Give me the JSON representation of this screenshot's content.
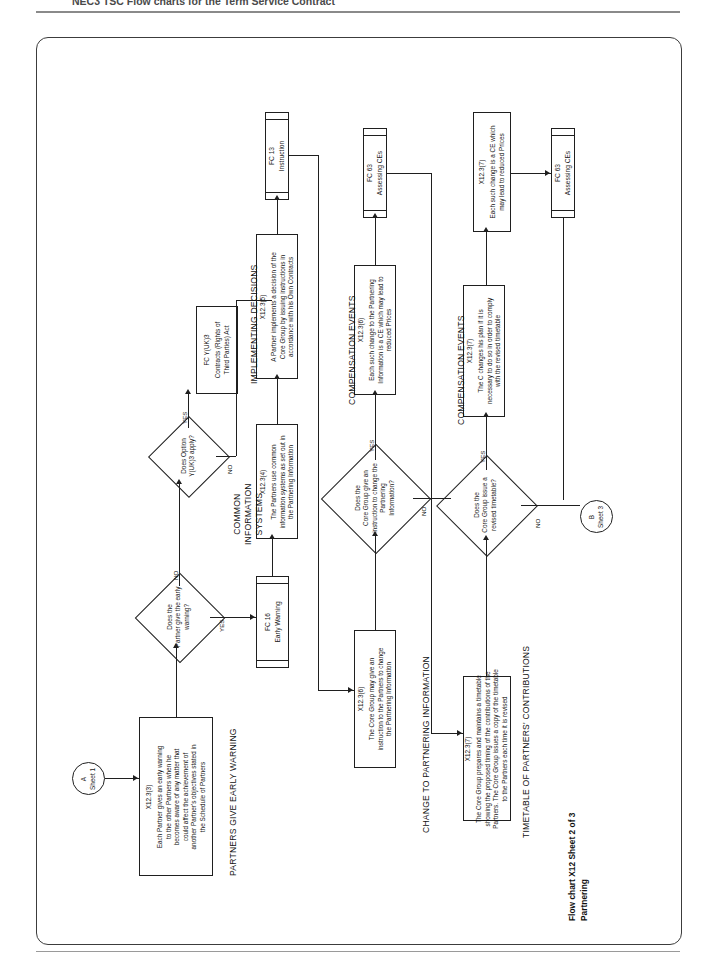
{
  "page": {
    "header_text": "NEC3  TSC  Flow charts for the Term Service Contract",
    "caption_line1": "Flow chart X12 Sheet 2 of 3",
    "caption_line2": "Partnering"
  },
  "sections": [
    {
      "id": "partners-give-early-warning",
      "label": "PARTNERS GIVE EARLY WARNING"
    },
    {
      "id": "common-information-systems",
      "label": "COMMON\nINFORMATION\nSYSTEMS"
    },
    {
      "id": "implementing-decisions",
      "label": "IMPLEMENTING DECISIONS"
    },
    {
      "id": "change-to-partnering-information",
      "label": "CHANGE TO PARTNERING INFORMATION"
    },
    {
      "id": "compensation-events-1",
      "label": "COMPENSATION EVENTS"
    },
    {
      "id": "compensation-events-2",
      "label": "COMPENSATION EVENTS"
    },
    {
      "id": "timetable-of-partners-contributions",
      "label": "TIMETABLE OF PARTNERS' CONTRIBUTIONS"
    }
  ],
  "connectors": [
    {
      "id": "a",
      "letter": "A",
      "sheet": "Sheet 1"
    },
    {
      "id": "b",
      "letter": "B",
      "sheet": "Sheet 3"
    }
  ],
  "nodes": {
    "x12_3_3": {
      "ref": "X12.3(3)",
      "text": "Each Partner gives an early warning\nto the other Partners when he\nbecomes aware of any matter that\ncould affect the achievement of\nanother Partner's objectives stated in\nthe Schedule of Partners"
    },
    "d_early_warning": {
      "text": "Does the\nPartner give the early\nwarning?"
    },
    "fc16": {
      "ref": "FC 16",
      "text": "Early Warning"
    },
    "d_option_yuk3": {
      "text": "Does Option\nY(UK)3 apply?"
    },
    "fc_yuk3": {
      "ref": "FC Y(UK)3",
      "text": "Contracts (Rights of\nThird Parties) Act"
    },
    "x12_3_4": {
      "ref": "X12.3(4)",
      "text": "The Partners use common\ninformation systems as set out in\nthe Partnering Information"
    },
    "x12_3_5": {
      "ref": "X12.3(5)",
      "text": "A Partner implements a decision of the\nCore Group by issuing instructions in\naccordance with his Own Contracts"
    },
    "fc13": {
      "ref": "FC 13",
      "text": "Instruction"
    },
    "x12_3_6_cg": {
      "ref": "X12.3(6)",
      "text": "The Core Group may give an\ninstruction to the Partners to change\nthe Partnering Information"
    },
    "d_instruction_change": {
      "text": "Does the\nCore Group give an\ninstruction to change the\nPartnering\nInformation?"
    },
    "x12_3_6_ce": {
      "ref": "X12.3(6)",
      "text": "Each such change to the Partnering\nInformation is a CE which may lead to\nreduced Prices"
    },
    "fc63_a": {
      "ref": "FC 63",
      "text": "Assessing CEs"
    },
    "x12_3_7_timetable": {
      "ref": "X12.3(7)",
      "text": "The Core Group prepares and maintains a timetable\nshowing the proposed timing of the contributions of the\nPartners. The Core Group issues a copy of the timetable\nto the Partners each time it is revised"
    },
    "d_revised_timetable": {
      "text": "Does the\nCore Group issue a\nrevised timetable?"
    },
    "x12_3_7_changes": {
      "ref": "X12.3(7)",
      "text": "The C changes his plan if it is\nnecessary to do so in order to comply\nwith the revised timetable"
    },
    "x12_3_7_ce": {
      "ref": "X12.3(7)",
      "text": "Each such change is a CE which\nmay lead to reduced Prices"
    },
    "fc63_b": {
      "ref": "FC 63",
      "text": "Assessing CEs"
    }
  },
  "branch_labels": {
    "ew_no": "NO",
    "ew_yes": "YES",
    "yuk3_yes": "YES",
    "yuk3_no": "NO",
    "instr_yes": "YES",
    "instr_no": "NO",
    "timetable_yes": "YES",
    "timetable_no": "NO"
  }
}
